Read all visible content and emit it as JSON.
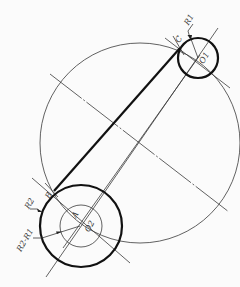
{
  "diagram": {
    "title": "",
    "points": {
      "O1": {
        "label": "O1",
        "x": 198,
        "y": 58
      },
      "O2": {
        "label": "O2",
        "x": 81,
        "y": 226
      },
      "A": {
        "label": "A",
        "x": 75,
        "y": 213
      },
      "B": {
        "label": "B",
        "x": 54,
        "y": 191
      },
      "C": {
        "label": "C",
        "x": 180,
        "y": 48
      }
    },
    "circles": {
      "small": {
        "center": "O1",
        "radius": 20,
        "label": "R1"
      },
      "outer_O2": {
        "center": "O2",
        "radius": 41,
        "label": "R2"
      },
      "inner_O2": {
        "center": "O2",
        "radius": 21,
        "label": "R2-R1"
      },
      "construction": {
        "cx": 140,
        "cy": 143,
        "r": 100
      }
    },
    "labels": {
      "R1": "R1",
      "R2": "R2",
      "R2_minus_R1": "R2-R1",
      "A": "A",
      "B": "B",
      "C": "C",
      "O1": "O1",
      "O2": "O2"
    }
  }
}
